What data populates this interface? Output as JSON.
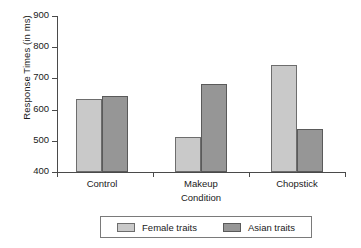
{
  "chart_data": {
    "type": "bar",
    "title": "",
    "xlabel": "Condition",
    "ylabel": "Response Times (in ms)",
    "categories": [
      "Control",
      "Makeup",
      "Chopstick"
    ],
    "series": [
      {
        "name": "Female traits",
        "values": [
          634,
          513,
          743
        ],
        "color": "#c9c9c9"
      },
      {
        "name": "Asian traits",
        "values": [
          644,
          681,
          537
        ],
        "color": "#969696"
      }
    ],
    "ylim": [
      400,
      900
    ],
    "yticks": [
      400,
      500,
      600,
      700,
      800,
      900
    ],
    "ytick_labels": [
      "400",
      "500",
      "600",
      "700",
      "800",
      "900"
    ],
    "grid": false,
    "legend_position": "bottom"
  },
  "axes": {
    "y_title": "Response Times (in ms)",
    "x_title": "Condition"
  },
  "legend": {
    "entries": [
      {
        "label": "Female traits"
      },
      {
        "label": "Asian traits"
      }
    ]
  }
}
